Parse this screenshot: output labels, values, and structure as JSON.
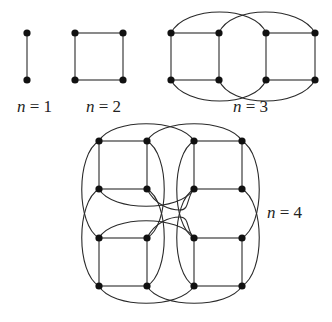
{
  "diagram": {
    "type": "hypercube-graphs",
    "labels": [
      {
        "var": "n",
        "eq": " = ",
        "val": "1"
      },
      {
        "var": "n",
        "eq": " = ",
        "val": "2"
      },
      {
        "var": "n",
        "eq": " = ",
        "val": "3"
      },
      {
        "var": "n",
        "eq": " = ",
        "val": "4"
      }
    ],
    "graphs": [
      {
        "n": 1,
        "vertices": 2,
        "edges": 1
      },
      {
        "n": 2,
        "vertices": 4,
        "edges": 4
      },
      {
        "n": 3,
        "vertices": 8,
        "edges": 12
      },
      {
        "n": 4,
        "vertices": 16,
        "edges": 32
      }
    ],
    "colors": {
      "edge": "#2a2a2a",
      "node": "#111111",
      "background": "#ffffff"
    }
  }
}
